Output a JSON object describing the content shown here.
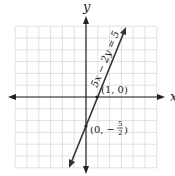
{
  "chart_data": {
    "type": "line",
    "title": "",
    "xlabel": "x",
    "ylabel": "y",
    "xlim": [
      -6,
      6
    ],
    "ylim": [
      -6,
      6
    ],
    "grid": true,
    "series": [
      {
        "name": "5x − 2y = 5",
        "equation": "5x - 2y = 5",
        "slope": 2.5,
        "intercept": -2.5,
        "x": [
          -1.3,
          3.3
        ],
        "y": [
          -5.75,
          5.75
        ]
      }
    ],
    "points": [
      {
        "x": 1,
        "y": 0,
        "label": "(1, 0)"
      },
      {
        "x": 0,
        "y": -2.5,
        "label": "(0, −5/2)"
      }
    ],
    "annotations": [
      "5x − 2y = 5",
      "(1, 0)",
      "(0, −5/2)"
    ]
  },
  "labels": {
    "x_axis": "x",
    "y_axis": "y",
    "equation": "5x − 2y = 5",
    "point1": "(1, 0)",
    "point2_prefix": "(0, −",
    "point2_num": "5",
    "point2_den": "2",
    "point2_suffix": ")"
  }
}
